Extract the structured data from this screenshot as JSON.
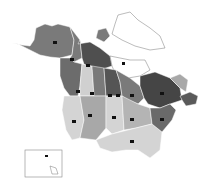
{
  "map": {
    "type": "choropleth",
    "title": "",
    "colors": {
      "background": "#ffffff",
      "darkest": "#3c3c3c",
      "dark": "#5a5a5a",
      "mid": "#7a7a7a",
      "light": "#a8a8a8",
      "lightest": "#d4d4d4",
      "unshaded": "#ffffff",
      "label_box": "#111111"
    },
    "labels_legible": false,
    "regions": [
      {
        "id": "alaska",
        "shade": "mid"
      },
      {
        "id": "yukon",
        "shade": "mid"
      },
      {
        "id": "northwest-territories",
        "shade": "dark"
      },
      {
        "id": "nunavut",
        "shade": "unshaded"
      },
      {
        "id": "british-columbia",
        "shade": "mid"
      },
      {
        "id": "alberta",
        "shade": "lightest"
      },
      {
        "id": "saskatchewan",
        "shade": "mid"
      },
      {
        "id": "manitoba",
        "shade": "dark"
      },
      {
        "id": "ontario",
        "shade": "mid"
      },
      {
        "id": "quebec",
        "shade": "darkest"
      },
      {
        "id": "labrador",
        "shade": "light"
      },
      {
        "id": "atlantic-provinces",
        "shade": "dark"
      },
      {
        "id": "us-west",
        "shade": "lightest"
      },
      {
        "id": "us-mountain",
        "shade": "light"
      },
      {
        "id": "us-plains",
        "shade": "lightest"
      },
      {
        "id": "us-midwest",
        "shade": "light"
      },
      {
        "id": "us-south",
        "shade": "lightest"
      },
      {
        "id": "us-northeast",
        "shade": "dark"
      },
      {
        "id": "hawaii-inset",
        "shade": "unshaded"
      }
    ]
  }
}
